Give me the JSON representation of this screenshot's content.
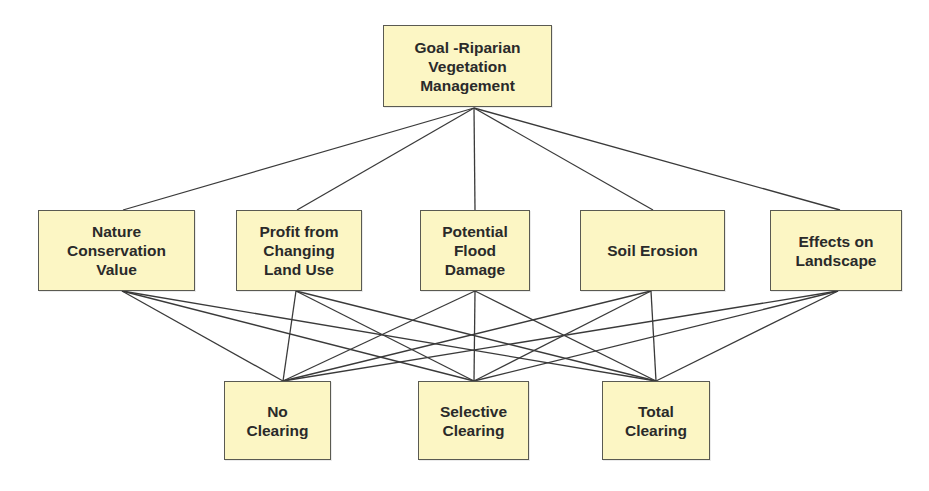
{
  "diagram": {
    "type": "hierarchy",
    "colors": {
      "node_fill": "#fcf6c4",
      "node_border": "#5a5a52",
      "line": "#3a3a3a",
      "text": "#2a2a2a"
    },
    "goal": {
      "id": "goal",
      "label": "Goal -Riparian\nVegetation\nManagement",
      "box": [
        383,
        25,
        169,
        82
      ],
      "top": [
        474,
        25
      ],
      "bottom": [
        474,
        108
      ]
    },
    "criteria": [
      {
        "id": "nature",
        "label": "Nature\nConservation\nValue",
        "box": [
          38,
          210,
          157,
          81
        ],
        "top": [
          123,
          210
        ],
        "bottom": [
          122,
          291
        ]
      },
      {
        "id": "profit",
        "label": "Profit from\nChanging\nLand Use",
        "box": [
          236,
          210,
          126,
          81
        ],
        "top": [
          297,
          210
        ],
        "bottom": [
          296,
          291
        ]
      },
      {
        "id": "flood",
        "label": "Potential\nFlood\nDamage",
        "box": [
          420,
          210,
          110,
          81
        ],
        "top": [
          475,
          210
        ],
        "bottom": [
          475,
          291
        ]
      },
      {
        "id": "erosion",
        "label": "Soil Erosion",
        "box": [
          580,
          210,
          145,
          81
        ],
        "top": [
          653,
          210
        ],
        "bottom": [
          651,
          291
        ]
      },
      {
        "id": "landscape",
        "label": "Effects on\nLandscape",
        "box": [
          770,
          210,
          132,
          81
        ],
        "top": [
          840,
          210
        ],
        "bottom": [
          838,
          291
        ]
      }
    ],
    "alternatives": [
      {
        "id": "no_clearing",
        "label": "No\nClearing",
        "box": [
          224,
          381,
          107,
          79
        ],
        "top": [
          283,
          381
        ]
      },
      {
        "id": "selective_clearing",
        "label": "Selective\nClearing",
        "box": [
          418,
          381,
          111,
          79
        ],
        "top": [
          474,
          381
        ]
      },
      {
        "id": "total_clearing",
        "label": "Total\nClearing",
        "box": [
          602,
          381,
          108,
          79
        ],
        "top": [
          656,
          381
        ]
      }
    ],
    "edges": "goal connects to every criterion; every criterion connects to every alternative"
  }
}
